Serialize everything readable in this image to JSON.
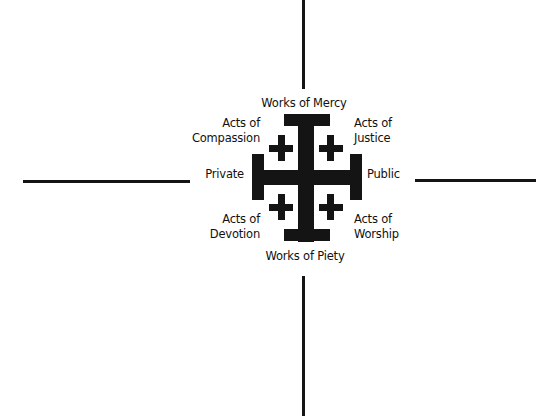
{
  "diagram": {
    "labels": {
      "top": "Works of Mercy",
      "bottom": "Works of Piety",
      "left": "Private",
      "right": "Public",
      "top_left": [
        "Acts of",
        "Compassion"
      ],
      "top_right": [
        "Acts of",
        "Justice"
      ],
      "bottom_left": [
        "Acts of",
        "Devotion"
      ],
      "bottom_right": [
        "Acts of",
        "Worship"
      ]
    },
    "symbol": "jerusalem-cross-icon",
    "colors": {
      "ink": "#141414",
      "background": "#ffffff"
    }
  }
}
